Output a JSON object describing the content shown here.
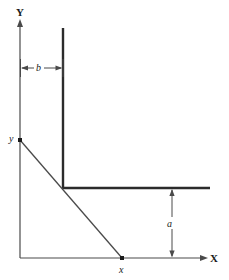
{
  "figure": {
    "background_color": "#ffffff",
    "line_color": "#3a3a3a",
    "thick_line_color": "#2b2b2b",
    "text_color": "#1a1a1a",
    "width": 229,
    "height": 280
  },
  "axes": {
    "y_axis": {
      "label": "Y",
      "label_x": 16,
      "label_y": 16,
      "x": 20,
      "y_top": 22,
      "y_bottom": 258,
      "arrow": "up"
    },
    "x_axis": {
      "label": "X",
      "label_x": 210,
      "label_y": 262,
      "y": 258,
      "x_left": 20,
      "x_right": 204,
      "arrow": "right"
    }
  },
  "corner_shape": {
    "name": "inverted-L-boundary",
    "vertical_x": 63,
    "vertical_y_top": 28,
    "vertical_y_bottom": 188,
    "horizontal_y": 188,
    "horizontal_x_left": 63,
    "horizontal_x_right": 210
  },
  "budget_line": {
    "y_intercept_label": "y",
    "y_intercept_label_x": 9,
    "y_intercept_label_y": 142,
    "x_intercept_label": "x",
    "x_intercept_label_x": 119,
    "x_intercept_label_y": 273,
    "from_x": 20,
    "from_y": 140,
    "to_x": 122,
    "to_y": 258
  },
  "dimensions": [
    {
      "name": "b",
      "label": "b",
      "orientation": "horizontal",
      "from": 20,
      "to": 63,
      "at": 68,
      "label_x": 38,
      "label_y": 66
    },
    {
      "name": "a",
      "label": "a",
      "orientation": "vertical",
      "from": 188,
      "to": 258,
      "at": 172,
      "label_x": 167,
      "label_y": 227
    }
  ]
}
